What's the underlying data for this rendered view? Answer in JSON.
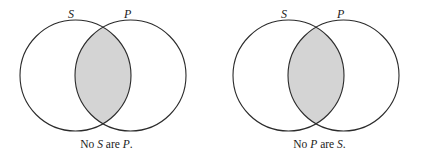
{
  "figure": {
    "type": "venn-diagram-pair",
    "background_color": "#ffffff",
    "stroke_color": "#2b2b2b",
    "shade_color": "#d4d4d4",
    "diagrams": [
      {
        "name": "no-s-are-p",
        "left_circle_label": "S",
        "right_circle_label": "P",
        "shaded_region": "intersection",
        "caption": {
          "prefix": "No ",
          "subject": "S",
          "middle": " are ",
          "predicate": "P",
          "suffix": "."
        }
      },
      {
        "name": "no-p-are-s",
        "left_circle_label": "S",
        "right_circle_label": "P",
        "shaded_region": "intersection",
        "caption": {
          "prefix": "No ",
          "subject": "P",
          "middle": " are ",
          "predicate": "S",
          "suffix": "."
        }
      }
    ]
  }
}
